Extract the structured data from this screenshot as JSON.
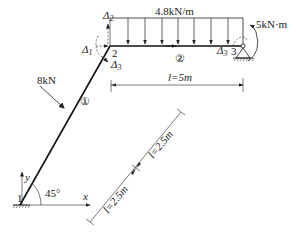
{
  "diagram": {
    "type": "structural-frame",
    "nodes": [
      {
        "id": "1",
        "label": "1",
        "support": "fixed"
      },
      {
        "id": "2",
        "label": "2",
        "support": "none"
      },
      {
        "id": "3",
        "label": "3",
        "support": "pinned"
      }
    ],
    "members": [
      {
        "id": "1",
        "label": "①",
        "from": "1",
        "to": "2",
        "angle": "45°"
      },
      {
        "id": "2",
        "label": "②",
        "from": "2",
        "to": "3"
      }
    ],
    "loads": {
      "distributed": {
        "label": "4.8kN/m",
        "member": "2"
      },
      "point": {
        "label": "8kN",
        "member": "1"
      },
      "moment": {
        "label": "5kN·m",
        "node": "3"
      }
    },
    "displacements": {
      "d1": "Δ",
      "d1_sub": "1",
      "d2": "Δ",
      "d2_sub": "2",
      "d3": "Δ",
      "d3_sub": "3",
      "d3b": "Δ",
      "d3b_sub": "3"
    },
    "dimensions": {
      "beam_span": "l=5m",
      "incline_lower": "l=2.5m",
      "incline_upper": "l=2.5m"
    },
    "axes": {
      "x": "x",
      "y": "y",
      "angle": "45°"
    }
  }
}
